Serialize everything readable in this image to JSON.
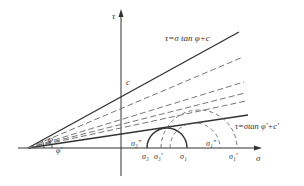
{
  "diagram": {
    "axes": {
      "y_label": "τ",
      "x_label": "σ"
    },
    "lines": {
      "upper": "τ=σ tan φ+c",
      "lower": "τ=σtan φ′+c′"
    },
    "intercept_label": "c",
    "angle_labels": {
      "phi": "φ",
      "phi_prime": "φ′"
    },
    "stress_labels": {
      "sigma3_dd": "σ₃″",
      "sigma3": "σ₃",
      "sigma3_p": "σ₃′",
      "sigma1": "σ₁",
      "sigma1_dd": "σ₁″",
      "sigma1_p": "σ₁′"
    },
    "colors": {
      "stroke": "#333333",
      "dashed": "#666666"
    }
  }
}
